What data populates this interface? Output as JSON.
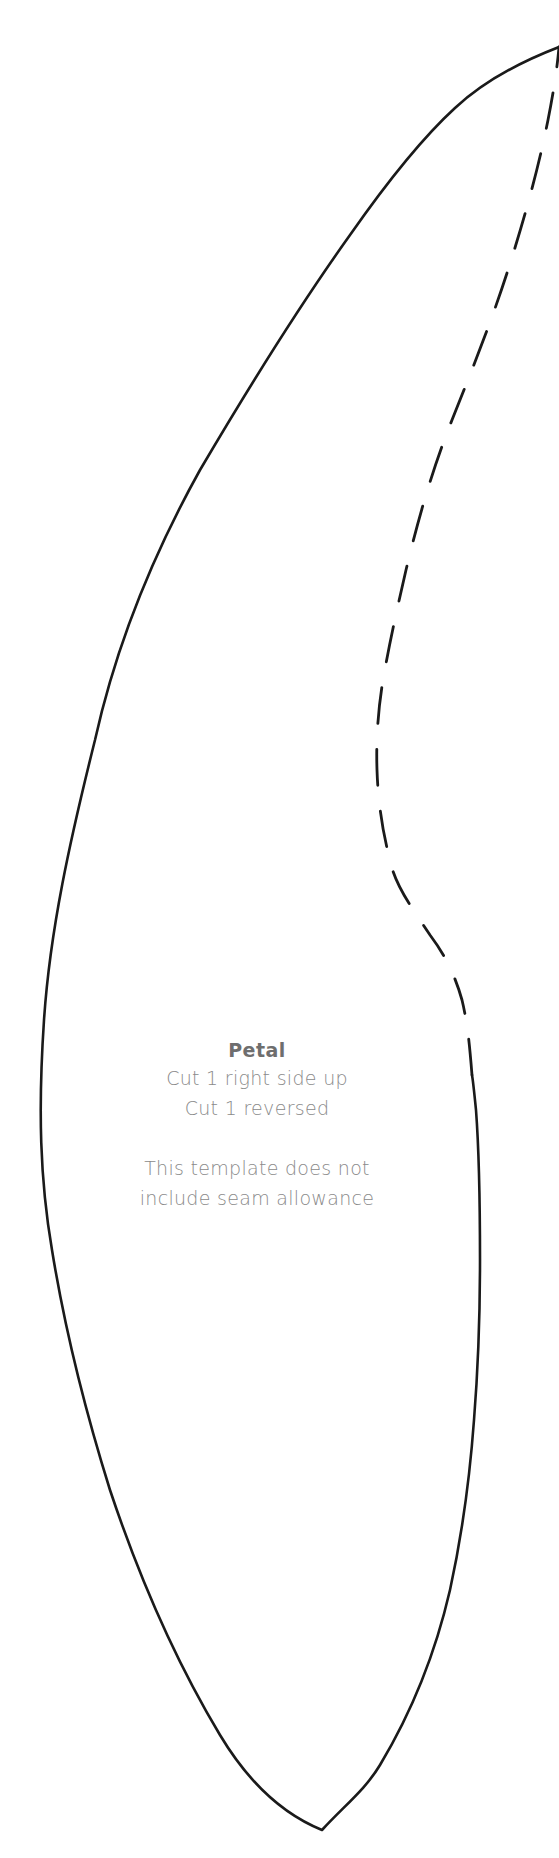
{
  "template": {
    "piece_name": "Petal",
    "instructions": [
      "Cut 1 right side up",
      "Cut 1 reversed"
    ],
    "note_lines": [
      "This template does not",
      "include seam allowance"
    ]
  },
  "colors": {
    "background": "#ffffff",
    "outline": "#1a1a1a",
    "label_title": "#6e6e6e",
    "label_text": "#8a8a8a"
  },
  "outline": {
    "cut_line_style": "solid",
    "seam_fold_line_style": "dashed"
  }
}
